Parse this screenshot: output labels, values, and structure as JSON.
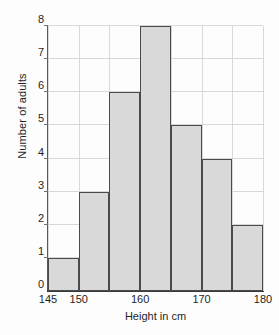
{
  "chart_data": {
    "type": "bar",
    "title": "",
    "subtitle": "",
    "xlabel": "Height in cm",
    "ylabel": "Number of adults",
    "xlim": [
      145,
      180
    ],
    "ylim": [
      0,
      8
    ],
    "grid": true,
    "legend": null,
    "bin_width": 5,
    "bin_edges": [
      145,
      150,
      155,
      160,
      165,
      170,
      175,
      180
    ],
    "categories": [
      "145-150",
      "150-155",
      "155-160",
      "160-165",
      "165-170",
      "170-175",
      "175-180"
    ],
    "values": [
      1,
      3,
      6,
      8,
      5,
      4,
      2
    ],
    "bars": [
      {
        "label": "145-150",
        "start": 145,
        "end": 150,
        "value": 1
      },
      {
        "label": "150-155",
        "start": 150,
        "end": 155,
        "value": 3
      },
      {
        "label": "155-160",
        "start": 155,
        "end": 160,
        "value": 6
      },
      {
        "label": "160-165",
        "start": 160,
        "end": 165,
        "value": 8
      },
      {
        "label": "165-170",
        "start": 165,
        "end": 170,
        "value": 5
      },
      {
        "label": "170-175",
        "start": 170,
        "end": 175,
        "value": 4
      },
      {
        "label": "175-180",
        "start": 175,
        "end": 180,
        "value": 2
      }
    ],
    "y_ticks": [
      0,
      1,
      2,
      3,
      4,
      5,
      6,
      7,
      8
    ],
    "y_tick_labels": [
      "0",
      "1",
      "2",
      "3",
      "4",
      "5",
      "6",
      "7",
      "8"
    ],
    "x_ticks": [
      145,
      150,
      155,
      160,
      165,
      170,
      175,
      180
    ],
    "x_tick_labels": [
      "145",
      "150",
      "",
      "160",
      "",
      "170",
      "",
      "180"
    ],
    "colors": {
      "bar_fill": "#d9d9d9",
      "bar_stroke": "#4a4a4a",
      "grid": "#d6d8da",
      "axis": "#3a3a3a",
      "text": "#1f1f1f",
      "background": "#fdfdfd"
    }
  }
}
